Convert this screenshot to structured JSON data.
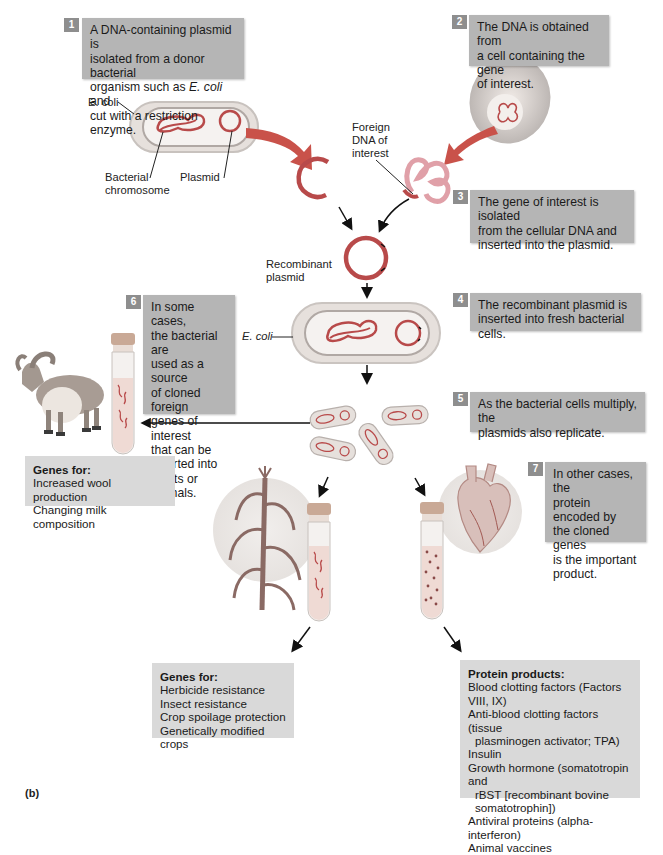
{
  "figure": {
    "panel_label": "(b)",
    "colors": {
      "step_box_bg": "#b5b5b5",
      "step_number_bg": "#8e8e8e",
      "info_box_bg": "#d9d9d9",
      "dna_red": "#b84a4a",
      "foreign_dna_pink": "#e0a0a8",
      "arrow_red": "#c9524a",
      "bacterium_fill": "#e9e3e0"
    },
    "steps": [
      {
        "number": "1",
        "lines": [
          "A DNA-containing plasmid is",
          "isolated from a donor bacterial",
          "organism such as E. coli and",
          "cut with a restriction enzyme."
        ]
      },
      {
        "number": "2",
        "lines": [
          "The DNA is obtained from",
          "a cell containing the gene",
          "of interest."
        ]
      },
      {
        "number": "3",
        "lines": [
          "The gene of interest is isolated",
          "from the cellular DNA and",
          "inserted into the plasmid."
        ]
      },
      {
        "number": "4",
        "lines": [
          "The recombinant plasmid is",
          "inserted into fresh bacterial cells."
        ]
      },
      {
        "number": "5",
        "lines": [
          "As the bacterial cells multiply, the",
          "plasmids also replicate."
        ]
      },
      {
        "number": "6",
        "lines": [
          "In some cases,",
          "the bacterial are",
          "used as a source",
          "of cloned foreign",
          "genes of interest",
          "that can be",
          "inserted into",
          "plants or animals."
        ]
      },
      {
        "number": "7",
        "lines": [
          "In other cases, the",
          "protein encoded by",
          "the cloned genes",
          "is the important",
          "product."
        ]
      }
    ],
    "labels": {
      "ecoli_top": "E. coli",
      "bacterial_chromosome": [
        "Bacterial",
        "chromosome"
      ],
      "plasmid": "Plasmid",
      "foreign_dna": [
        "Foreign",
        "DNA of",
        "interest"
      ],
      "recombinant_plasmid": [
        "Recombinant",
        "plasmid"
      ],
      "ecoli_middle": "E. coli"
    },
    "info_boxes": {
      "animals": {
        "title": "Genes for:",
        "items": [
          "Increased wool production",
          "Changing milk composition"
        ]
      },
      "plants": {
        "title": "Genes for:",
        "items": [
          "Herbicide resistance",
          "Insect resistance",
          "Crop spoilage protection",
          "Genetically modified crops"
        ]
      },
      "proteins": {
        "title": "Protein products:",
        "items": [
          "Blood clotting factors (Factors VIII, IX)",
          "Anti-blood clotting factors (tissue",
          "plasminogen activator; TPA)",
          "Insulin",
          "Growth hormone (somatotropin and",
          "rBST [recombinant bovine",
          "somatotrophin])",
          "Antiviral proteins (alpha-interferon)",
          "Animal vaccines"
        ]
      }
    },
    "icons": [
      "bacterium-icon",
      "plasmid-icon",
      "cut-plasmid-icon",
      "cell-icon",
      "foreign-dna-icon",
      "recombinant-plasmid-icon",
      "test-tube-icon",
      "goat-icon",
      "corn-plant-icon",
      "heart-icon",
      "arrow-icon"
    ]
  }
}
